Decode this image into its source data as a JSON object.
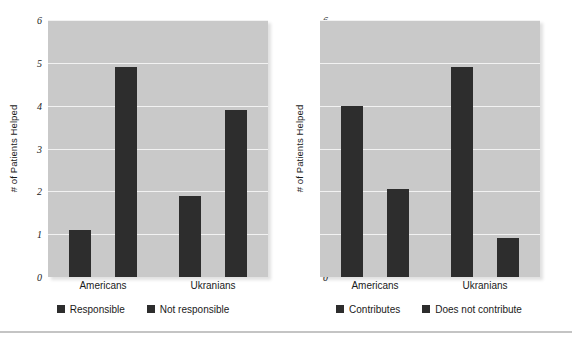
{
  "figure": {
    "background_color": "#ffffff",
    "plot_background_color": "#c9c9c9",
    "bar_color": "#2d2d2d",
    "gridline_color": "#f2f2f2",
    "rule_color": "#c4c4c4"
  },
  "chart_data": [
    {
      "type": "bar",
      "title": "",
      "xlabel": "",
      "ylabel": "# of Patients Helped",
      "categories": [
        "Americans",
        "Ukranians"
      ],
      "ylim": [
        0,
        6
      ],
      "yticks": [
        0,
        1,
        2,
        3,
        4,
        5,
        6
      ],
      "ytick_labels": [
        "0",
        "1",
        "2",
        "3",
        "4",
        "5",
        "6"
      ],
      "grid": true,
      "legend_position": "bottom",
      "series": [
        {
          "name": "Responsible",
          "values": [
            1.1,
            1.9
          ]
        },
        {
          "name": "Not responsible",
          "values": [
            4.9,
            3.9
          ]
        }
      ]
    },
    {
      "type": "bar",
      "title": "",
      "xlabel": "",
      "ylabel": "# of Patients Helped",
      "categories": [
        "Americans",
        "Ukranians"
      ],
      "ylim": [
        0,
        6
      ],
      "yticks": [
        0,
        1,
        2,
        3,
        4,
        5,
        6
      ],
      "ytick_labels": [
        "0",
        "1",
        "2",
        "3",
        "4",
        "5",
        "6"
      ],
      "grid": true,
      "legend_position": "bottom",
      "series": [
        {
          "name": "Contributes",
          "values": [
            4.0,
            4.9
          ]
        },
        {
          "name": "Does not contribute",
          "values": [
            2.05,
            0.9
          ]
        }
      ]
    }
  ]
}
